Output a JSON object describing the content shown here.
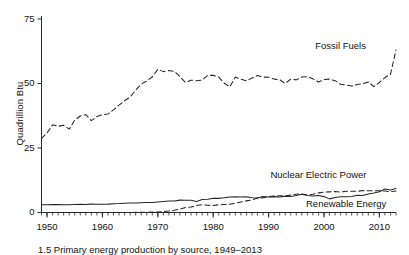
{
  "figure": {
    "caption": "1.5 Primary energy production by source, 1949–2013",
    "ylabel": "Quadrillion Btu"
  },
  "chart_data": {
    "type": "line",
    "title": "",
    "xlabel": "",
    "ylabel": "Quadrillion Btu",
    "xlim": [
      1949,
      2013
    ],
    "ylim": [
      0,
      75
    ],
    "yticks": [
      0,
      25,
      50,
      75
    ],
    "xticks": [
      1950,
      1960,
      1970,
      1980,
      1990,
      2000,
      2010
    ],
    "xtick_labels": [
      "1950",
      "1960",
      "1970",
      "1980",
      "1990",
      "2000",
      "2010"
    ],
    "ytick_labels": [
      "0",
      "25",
      "50",
      "75"
    ],
    "minor_xtick_interval": 1,
    "grid": false,
    "legend": "inline-annotations",
    "annotations": [
      {
        "text": "Fossil Fuels",
        "x": 2003,
        "y": 64.5
      },
      {
        "text": "Nuclear Electric Power",
        "x": 1999,
        "y": 14.5
      },
      {
        "text": "Renewable Energy",
        "x": 2004,
        "y": 3.2
      }
    ],
    "x": [
      1949,
      1950,
      1951,
      1952,
      1953,
      1954,
      1955,
      1956,
      1957,
      1958,
      1959,
      1960,
      1961,
      1962,
      1963,
      1964,
      1965,
      1966,
      1967,
      1968,
      1969,
      1970,
      1971,
      1972,
      1973,
      1974,
      1975,
      1976,
      1977,
      1978,
      1979,
      1980,
      1981,
      1982,
      1983,
      1984,
      1985,
      1986,
      1987,
      1988,
      1989,
      1990,
      1991,
      1992,
      1993,
      1994,
      1995,
      1996,
      1997,
      1998,
      1999,
      2000,
      2001,
      2002,
      2003,
      2004,
      2005,
      2006,
      2007,
      2008,
      2009,
      2010,
      2011,
      2012,
      2013
    ],
    "series": [
      {
        "name": "Fossil Fuels",
        "style": "dashed",
        "values": [
          28.7,
          30.8,
          34.0,
          33.4,
          33.8,
          32.3,
          35.8,
          37.4,
          37.9,
          35.6,
          37.2,
          37.9,
          38.2,
          39.8,
          41.6,
          43.3,
          44.8,
          47.4,
          49.8,
          51.0,
          52.5,
          55.5,
          54.6,
          55.0,
          54.7,
          52.6,
          50.4,
          51.3,
          51.1,
          51.3,
          53.1,
          53.2,
          52.5,
          50.1,
          48.7,
          52.5,
          51.7,
          51.0,
          52.1,
          53.1,
          52.5,
          52.4,
          51.7,
          51.5,
          50.0,
          51.7,
          51.4,
          52.5,
          52.6,
          51.8,
          50.6,
          51.5,
          51.7,
          51.1,
          49.7,
          49.4,
          49.0,
          49.6,
          49.9,
          50.6,
          48.8,
          50.4,
          52.3,
          53.5,
          63.0
        ]
      },
      {
        "name": "Nuclear Electric Power",
        "style": "dashed",
        "values": [
          0.0,
          0.0,
          0.0,
          0.0,
          0.0,
          0.0,
          0.0,
          0.0,
          0.0,
          0.0,
          0.0,
          0.0,
          0.0,
          0.0,
          0.0,
          0.0,
          0.0,
          0.1,
          0.1,
          0.1,
          0.2,
          0.2,
          0.4,
          0.6,
          0.9,
          1.3,
          1.9,
          2.1,
          2.7,
          3.0,
          2.8,
          2.7,
          3.0,
          3.1,
          3.2,
          3.6,
          4.1,
          4.5,
          4.9,
          5.6,
          5.7,
          6.1,
          6.4,
          6.5,
          6.4,
          6.8,
          7.1,
          7.2,
          6.7,
          7.1,
          7.6,
          7.9,
          8.0,
          8.1,
          7.9,
          8.2,
          8.2,
          8.2,
          8.5,
          8.4,
          8.4,
          8.4,
          8.3,
          8.1,
          8.3
        ]
      },
      {
        "name": "Renewable Energy",
        "style": "solid",
        "values": [
          2.97,
          2.98,
          3.05,
          3.07,
          2.97,
          2.98,
          3.1,
          3.15,
          3.1,
          3.25,
          3.2,
          3.2,
          3.25,
          3.4,
          3.45,
          3.55,
          3.65,
          3.7,
          3.8,
          3.85,
          3.85,
          4.08,
          4.25,
          4.45,
          4.45,
          4.8,
          4.75,
          4.75,
          4.25,
          5.04,
          5.17,
          5.49,
          5.48,
          5.68,
          6.0,
          6.14,
          6.03,
          6.12,
          5.69,
          5.58,
          6.21,
          6.04,
          6.15,
          6.03,
          6.26,
          6.17,
          6.56,
          7.09,
          6.57,
          6.42,
          6.58,
          6.16,
          5.28,
          5.84,
          6.07,
          6.12,
          6.23,
          6.69,
          6.59,
          7.19,
          7.52,
          8.07,
          9.13,
          8.74,
          9.3
        ]
      }
    ]
  }
}
